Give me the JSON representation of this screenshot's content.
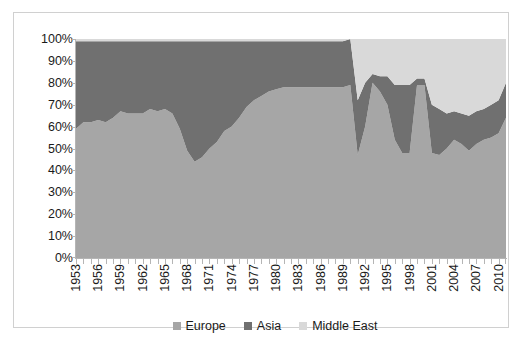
{
  "chart_data": {
    "type": "area",
    "stacked": true,
    "stack_mode": "100%",
    "title": "",
    "xlabel": "",
    "ylabel": "",
    "ylim": [
      0,
      100
    ],
    "ytick_labels": [
      "0%",
      "10%",
      "20%",
      "30%",
      "40%",
      "50%",
      "60%",
      "70%",
      "80%",
      "90%",
      "100%"
    ],
    "ytick_values": [
      0,
      10,
      20,
      30,
      40,
      50,
      60,
      70,
      80,
      90,
      100
    ],
    "grid": false,
    "legend_position": "bottom",
    "x": [
      1953,
      1954,
      1955,
      1956,
      1957,
      1958,
      1959,
      1960,
      1961,
      1962,
      1963,
      1964,
      1965,
      1966,
      1967,
      1968,
      1969,
      1970,
      1971,
      1972,
      1973,
      1974,
      1975,
      1976,
      1977,
      1978,
      1979,
      1980,
      1981,
      1982,
      1983,
      1984,
      1985,
      1986,
      1987,
      1988,
      1989,
      1990,
      1991,
      1992,
      1993,
      1994,
      1995,
      1996,
      1997,
      1998,
      1999,
      2000,
      2001,
      2002,
      2003,
      2004,
      2005,
      2006,
      2007,
      2008,
      2009,
      2010,
      2011
    ],
    "xtick_labels": [
      "1953",
      "1956",
      "1959",
      "1962",
      "1965",
      "1968",
      "1971",
      "1974",
      "1977",
      "1980",
      "1983",
      "1986",
      "1989",
      "1992",
      "1995",
      "1998",
      "2001",
      "2004",
      "2007",
      "2010"
    ],
    "xtick_values": [
      1953,
      1956,
      1959,
      1962,
      1965,
      1968,
      1971,
      1974,
      1977,
      1980,
      1983,
      1986,
      1989,
      1992,
      1995,
      1998,
      2001,
      2004,
      2007,
      2010
    ],
    "series": [
      {
        "name": "Europe",
        "color": "#a6a6a6",
        "values": [
          59,
          62,
          62,
          63,
          62,
          64,
          67,
          66,
          66,
          66,
          68,
          67,
          68,
          66,
          59,
          49,
          44,
          46,
          50,
          53,
          58,
          60,
          64,
          69,
          72,
          74,
          76,
          77,
          78,
          78,
          78,
          78,
          78,
          78,
          78,
          78,
          78,
          79,
          47,
          60,
          80,
          76,
          70,
          54,
          48,
          48,
          79,
          79,
          48,
          47,
          50,
          54,
          52,
          49,
          52,
          54,
          55,
          57,
          64
        ]
      },
      {
        "name": "Asia",
        "color": "#707070",
        "values": [
          40,
          37,
          37,
          36,
          37,
          35,
          32,
          33,
          33,
          33,
          31,
          32,
          31,
          33,
          40,
          50,
          55,
          53,
          49,
          46,
          41,
          39,
          35,
          30,
          27,
          25,
          23,
          22,
          21,
          21,
          21,
          21,
          21,
          21,
          21,
          21,
          21,
          21,
          25,
          20,
          4,
          7,
          13,
          25,
          31,
          31,
          3,
          3,
          22,
          21,
          16,
          13,
          14,
          16,
          15,
          14,
          15,
          15,
          16
        ]
      },
      {
        "name": "Middle East",
        "color": "#d9d9d9",
        "values": [
          1,
          1,
          1,
          1,
          1,
          1,
          1,
          1,
          1,
          1,
          1,
          1,
          1,
          1,
          1,
          1,
          1,
          1,
          1,
          1,
          1,
          1,
          1,
          1,
          1,
          1,
          1,
          1,
          1,
          1,
          1,
          1,
          1,
          1,
          1,
          1,
          1,
          0,
          28,
          20,
          16,
          17,
          17,
          21,
          21,
          21,
          18,
          18,
          30,
          32,
          34,
          33,
          34,
          35,
          33,
          32,
          30,
          28,
          20
        ]
      }
    ]
  },
  "legend": {
    "items": [
      {
        "label": "Europe",
        "color": "#a6a6a6",
        "marker": "square-swatch"
      },
      {
        "label": "Asia",
        "color": "#707070",
        "marker": "square-swatch"
      },
      {
        "label": "Middle East",
        "color": "#d9d9d9",
        "marker": "square-swatch"
      }
    ]
  },
  "colors": {
    "frame_border": "#d0d0d0",
    "axis_line": "#b5b5b5",
    "tick_text": "#1a1a1a",
    "plot_background": "#ffffff"
  }
}
